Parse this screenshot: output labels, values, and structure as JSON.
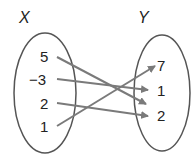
{
  "diagram": {
    "type": "mapping-diagram",
    "domain_set": {
      "label": "X",
      "elements": [
        "5",
        "−3",
        "2",
        "1"
      ]
    },
    "range_set": {
      "label": "Y",
      "elements": [
        "7",
        "1",
        "2"
      ]
    },
    "mappings": [
      {
        "from": "5",
        "to": "2"
      },
      {
        "from": "−3",
        "to": "1"
      },
      {
        "from": "2",
        "to": "2"
      },
      {
        "from": "1",
        "to": "7"
      }
    ],
    "colors": {
      "ellipse": "#555555",
      "arrow": "#7a7a7a",
      "text": "#222222"
    }
  }
}
